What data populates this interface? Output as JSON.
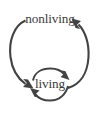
{
  "diagram": {
    "type": "cycle-diagram",
    "title": "",
    "background_color": "#ffffff",
    "stroke_color": "#434343",
    "text_color": "#3b3b3b",
    "nodes": [
      {
        "id": "nonliving",
        "label": "nonliving",
        "position": "top"
      },
      {
        "id": "living",
        "label": "living",
        "position": "bottom"
      }
    ],
    "edges": [
      {
        "id": "nonliving-to-living",
        "from": "nonliving",
        "to": "living",
        "label": "",
        "shape": "large-left-arc",
        "arrowhead_at": "living",
        "arrowhead_direction": "down-right"
      },
      {
        "id": "living-to-nonliving",
        "from": "living",
        "to": "nonliving",
        "label": "",
        "shape": "large-right-arc",
        "arrowhead_at": "nonliving",
        "arrowhead_direction": "up-left"
      },
      {
        "id": "living-self-loop-top",
        "from": "living",
        "to": "living",
        "label": "",
        "shape": "small-circle-top-arc",
        "arrowhead_at": "right",
        "arrowhead_direction": "down-right"
      },
      {
        "id": "living-self-loop-bottom",
        "from": "living",
        "to": "living",
        "label": "",
        "shape": "small-circle-bottom-arc",
        "arrowhead_at": "left",
        "arrowhead_direction": "up-left"
      }
    ]
  }
}
